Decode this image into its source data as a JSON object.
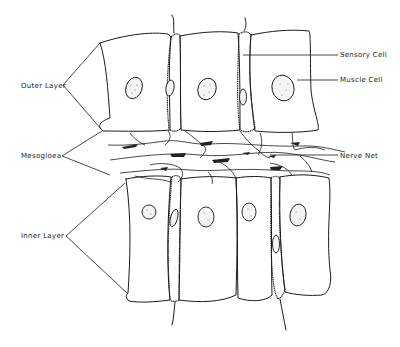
{
  "diagram": {
    "labels_left": [
      {
        "id": "outer-layer",
        "text": "Outer Layer"
      },
      {
        "id": "mesogloea",
        "text": "Mesogloea"
      },
      {
        "id": "inner-layer",
        "text": "Inner Layer"
      }
    ],
    "labels_right": [
      {
        "id": "sensory-cell",
        "text": "Sensory Cell"
      },
      {
        "id": "muscle-cell",
        "text": "Muscle Cell"
      },
      {
        "id": "nerve-net",
        "text": "Nerve Net"
      }
    ],
    "colors": {
      "ink": "#1a1a1a",
      "background": "#ffffff"
    }
  }
}
